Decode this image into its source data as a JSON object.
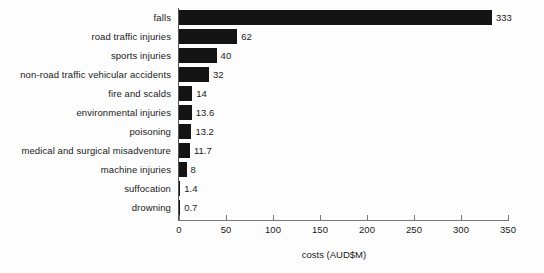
{
  "chart_data": {
    "type": "bar",
    "orientation": "horizontal",
    "title": "",
    "subtitle": "",
    "xlabel": "costs (AUD$M)",
    "ylabel": "",
    "xlim": [
      0,
      350
    ],
    "xticks": [
      0,
      50,
      100,
      150,
      200,
      250,
      300,
      350
    ],
    "xtick_labels": [
      "0",
      "50",
      "100",
      "150",
      "200",
      "250",
      "300",
      "350"
    ],
    "grid": false,
    "legend": null,
    "bar_color": "#141414",
    "categories": [
      "falls",
      "road traffic injuries",
      "sports injuries",
      "non-road traffic vehicular accidents",
      "fire and scalds",
      "environmental injuries",
      "poisoning",
      "medical and surgical misadventure",
      "machine injuries",
      "suffocation",
      "drowning"
    ],
    "values": [
      333,
      62,
      40,
      32,
      14,
      13.6,
      13.2,
      11.7,
      8,
      1.4,
      0.7
    ],
    "value_labels": [
      "333",
      "62",
      "40",
      "32",
      "14",
      "13.6",
      "13.2",
      "11.7",
      "8",
      "1.4",
      "0.7"
    ]
  }
}
